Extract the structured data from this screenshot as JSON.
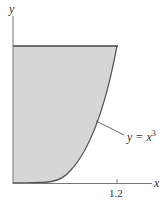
{
  "diagram": {
    "type": "shaded region under curve",
    "axes": {
      "x_label": "x",
      "y_label": "y"
    },
    "x_tick": "1.2",
    "curve_label": "y = x",
    "curve_exponent": "3",
    "region": "bounded by y-axis, line y = 1.2^3, and curve y = x^3 for 0 ≤ x ≤ 1.2",
    "colors": {
      "fill": "#d4d4d4",
      "stroke": "#555555"
    }
  }
}
